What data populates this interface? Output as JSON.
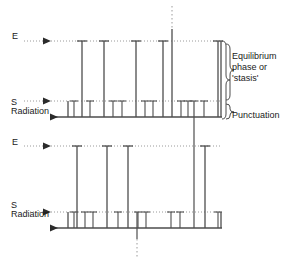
{
  "figure": {
    "type": "punctuated-equilibrium-diagram",
    "labels": {
      "energy_top": "E",
      "energy_bottom": "E",
      "source_top": "S",
      "radiation_top": "Radiation",
      "source_bottom": "S",
      "radiation_bottom": "Radiation",
      "equilibrium": "Equilibrium\nphase or\n'stasis'",
      "punctuation": "Punctuation"
    },
    "colors": {
      "stroke": "#4d4d4d",
      "dotted": "#9a9a9a",
      "text": "#1a1a1a",
      "background": "#ffffff"
    },
    "panels": [
      {
        "name": "top-panel",
        "baseline_y": 117,
        "short_level_y": 101,
        "tall_level_y": 41,
        "axis_x": 68,
        "axis_right_x": 221,
        "tall_bars": [
          82,
          104,
          136,
          163,
          172,
          218
        ],
        "short_ticks": [
          74,
          90,
          113,
          122,
          145,
          153,
          181,
          188,
          194,
          204
        ],
        "overshoot_bar": {
          "x": 172,
          "top_y": 29
        },
        "dotted_top": {
          "x": 172,
          "from_y": 6,
          "to_y": 29
        },
        "crossing_line": {
          "x": 194,
          "from_y": 101,
          "to_y": 205
        }
      },
      {
        "name": "bottom-panel",
        "baseline_y": 228,
        "short_level_y": 212,
        "tall_level_y": 146,
        "axis_x": 68,
        "axis_right_x": 221,
        "tall_bars": [
          77,
          107,
          128,
          194,
          205
        ],
        "short_ticks": [
          74,
          85,
          93,
          118,
          138,
          146,
          171,
          180,
          188,
          218
        ],
        "dotted_bottom": {
          "x": 137,
          "from_y": 228,
          "to_y": 256
        }
      }
    ],
    "braces": [
      {
        "name": "equilibrium-brace",
        "x": 226,
        "top_y": 41,
        "bottom_y": 101
      },
      {
        "name": "punctuation-brace",
        "x": 226,
        "top_y": 103,
        "bottom_y": 119
      },
      {
        "name": "outer-brace",
        "x": 222,
        "top_y": 41,
        "bottom_y": 119
      }
    ]
  }
}
